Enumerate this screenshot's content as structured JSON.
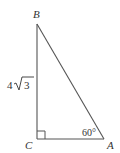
{
  "diagram": {
    "type": "right-triangle",
    "vertices": {
      "A": {
        "label": "A"
      },
      "B": {
        "label": "B"
      },
      "C": {
        "label": "C"
      }
    },
    "side_BC": {
      "coef": "4",
      "radicand": "3",
      "text": "4√3"
    },
    "angle_A": {
      "text": "60°"
    },
    "right_angle_at": "C",
    "stroke_color": "#555555",
    "label_color": "#333333"
  }
}
